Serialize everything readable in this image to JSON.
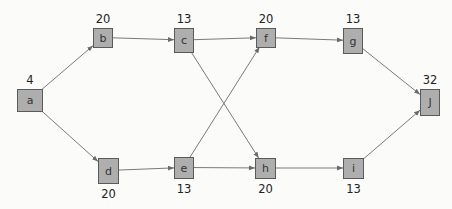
{
  "diagram": {
    "type": "directed-network",
    "nodes": [
      {
        "id": "a",
        "label": "a",
        "value": "4",
        "x": 17,
        "y": 89,
        "w": 25,
        "h": 22,
        "value_pos": "above"
      },
      {
        "id": "b",
        "label": "b",
        "value": "20",
        "x": 93,
        "y": 28,
        "w": 19,
        "h": 19,
        "value_pos": "above"
      },
      {
        "id": "c",
        "label": "c",
        "value": "13",
        "x": 174,
        "y": 28,
        "w": 19,
        "h": 24,
        "value_pos": "above"
      },
      {
        "id": "d",
        "label": "d",
        "value": "20",
        "x": 98,
        "y": 158,
        "w": 20,
        "h": 25,
        "value_pos": "below"
      },
      {
        "id": "e",
        "label": "e",
        "value": "13",
        "x": 174,
        "y": 157,
        "w": 19,
        "h": 21,
        "value_pos": "below"
      },
      {
        "id": "f",
        "label": "f",
        "value": "20",
        "x": 256,
        "y": 28,
        "w": 19,
        "h": 19,
        "value_pos": "above"
      },
      {
        "id": "g",
        "label": "g",
        "value": "13",
        "x": 343,
        "y": 28,
        "w": 19,
        "h": 25,
        "value_pos": "above"
      },
      {
        "id": "h",
        "label": "h",
        "value": "20",
        "x": 255,
        "y": 158,
        "w": 20,
        "h": 20,
        "value_pos": "below"
      },
      {
        "id": "i",
        "label": "i",
        "value": "13",
        "x": 343,
        "y": 158,
        "w": 20,
        "h": 20,
        "value_pos": "below"
      },
      {
        "id": "j",
        "label": "J",
        "value": "32",
        "x": 420,
        "y": 89,
        "w": 19,
        "h": 26,
        "value_pos": "above"
      }
    ],
    "edges": [
      {
        "from": "a",
        "to": "b"
      },
      {
        "from": "a",
        "to": "d"
      },
      {
        "from": "b",
        "to": "c"
      },
      {
        "from": "c",
        "to": "f"
      },
      {
        "from": "c",
        "to": "h"
      },
      {
        "from": "d",
        "to": "e"
      },
      {
        "from": "e",
        "to": "f"
      },
      {
        "from": "e",
        "to": "h"
      },
      {
        "from": "f",
        "to": "g"
      },
      {
        "from": "h",
        "to": "i"
      },
      {
        "from": "g",
        "to": "j"
      },
      {
        "from": "i",
        "to": "j"
      }
    ],
    "colors": {
      "background": "#fbfbfa",
      "node_fill": "#aeaeae",
      "node_stroke": "#5a5a5a",
      "edge": "#7a7a7a",
      "text": "#222222"
    }
  }
}
